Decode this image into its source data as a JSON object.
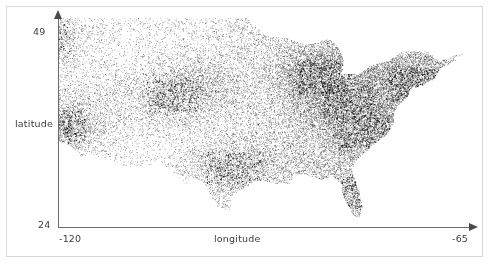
{
  "figure": {
    "type": "scatter-plot",
    "background_color": "#ffffff",
    "border_color": "#d8d8d6",
    "point_color": "#111111",
    "axis_color": "#6b6b6b"
  },
  "axes": {
    "y_label": "latitude",
    "x_label": "longitude",
    "y_tick_max": "49",
    "y_tick_min": "24",
    "x_tick_min": "-120",
    "x_tick_max": "-65"
  },
  "chart_data": {
    "type": "scatter",
    "title": "",
    "xlabel": "longitude",
    "ylabel": "latitude",
    "xlim": [
      -120,
      -65
    ],
    "ylim": [
      24,
      49
    ],
    "xticks": [
      -120,
      -65
    ],
    "yticks": [
      24,
      49
    ],
    "grid": false,
    "legend": null,
    "point_color": "#111111",
    "marker_size": 0.6,
    "approx_point_count": 25000,
    "density_clusters": [
      {
        "name": "Northeast corridor (Boston-New York-Philadelphia)",
        "x": -73.5,
        "y": 41.0,
        "density": "very-high"
      },
      {
        "name": "Great Lakes / Chicago-Detroit-Cleveland",
        "x": -85.0,
        "y": 42.0,
        "density": "very-high"
      },
      {
        "name": "Ohio Valley / Appalachia",
        "x": -82.0,
        "y": 39.0,
        "density": "high"
      },
      {
        "name": "Southeast Piedmont / Carolinas",
        "x": -80.0,
        "y": 35.5,
        "density": "high"
      },
      {
        "name": "Florida peninsula",
        "x": -81.5,
        "y": 28.0,
        "density": "medium"
      },
      {
        "name": "Texas Triangle (Dallas-Houston-San Antonio)",
        "x": -97.0,
        "y": 31.0,
        "density": "medium"
      },
      {
        "name": "California coast (San Francisco-Los Angeles-San Diego)",
        "x": -120.0,
        "y": 36.0,
        "density": "high"
      },
      {
        "name": "Pacific Northwest (Seattle-Portland)",
        "x": -122.0,
        "y": 46.5,
        "density": "medium"
      },
      {
        "name": "Front Range (Denver)",
        "x": -105.0,
        "y": 39.8,
        "density": "medium"
      },
      {
        "name": "Great Plains interior",
        "x": -101.0,
        "y": 41.0,
        "density": "low"
      },
      {
        "name": "Mountain West / Great Basin",
        "x": -115.0,
        "y": 40.0,
        "density": "very-low"
      }
    ]
  }
}
